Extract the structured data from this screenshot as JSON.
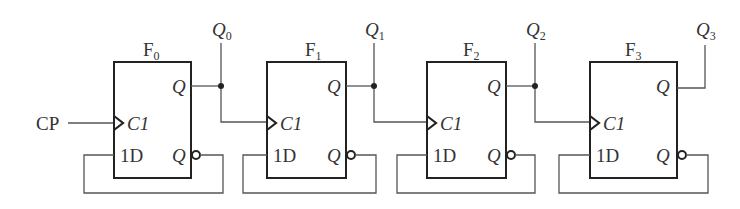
{
  "diagram": {
    "type": "4-bit asynchronous counter (D flip-flops, T' configuration)",
    "clock_input": {
      "label": "CP"
    },
    "flipflops": [
      {
        "id": "F0",
        "name": "F",
        "sub": "0",
        "x": 114,
        "output_label": "Q",
        "output_sub": "0",
        "clk_label": "C1",
        "d_label": "1D",
        "q_label": "Q",
        "qbar_label": "Q"
      },
      {
        "id": "F1",
        "name": "F",
        "sub": "1",
        "x": 267,
        "output_label": "Q",
        "output_sub": "1",
        "clk_label": "C1",
        "d_label": "1D",
        "q_label": "Q",
        "qbar_label": "Q"
      },
      {
        "id": "F2",
        "name": "F",
        "sub": "2",
        "x": 427,
        "output_label": "Q",
        "output_sub": "2",
        "clk_label": "C1",
        "d_label": "1D",
        "q_label": "Q",
        "qbar_label": "Q"
      },
      {
        "id": "F3",
        "name": "F",
        "sub": "3",
        "x": 590,
        "output_label": "Q",
        "output_sub": "3",
        "clk_label": "C1",
        "d_label": "1D",
        "q_label": "Q",
        "qbar_label": "Q"
      }
    ],
    "connections": [
      "CP -> F0.C1",
      "F0.Q -> F1.C1",
      "F1.Q -> F2.C1",
      "F2.Q -> F3.C1",
      "F0.Qbar -> F0.1D",
      "F1.Qbar -> F1.1D",
      "F2.Qbar -> F2.1D",
      "F3.Qbar -> F3.1D"
    ],
    "colors": {
      "line": "#555555",
      "box": "#222222",
      "text": "#333333"
    }
  }
}
